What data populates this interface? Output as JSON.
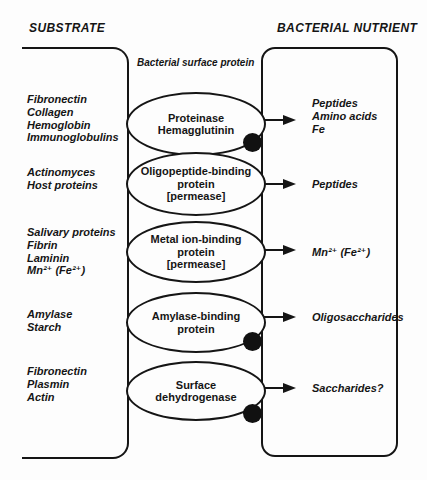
{
  "headers": {
    "substrate": "SUBSTRATE",
    "nutrient": "BACTERIAL NUTRIENT",
    "surface_protein": "Bacterial surface protein"
  },
  "colors": {
    "ink": "#151515",
    "background": "#fdfdfd"
  },
  "rows": [
    {
      "substrates": [
        "Fibronectin",
        "Collagen",
        "Hemoglobin",
        "Immunoglobulins"
      ],
      "protein_lines": [
        "Proteinase",
        "Hemagglutinin"
      ],
      "nutrients": [
        "Peptides",
        "Amino acids",
        "Fe"
      ],
      "membrane_dot": true
    },
    {
      "substrates": [
        "Actinomyces",
        "Host proteins"
      ],
      "protein_lines": [
        "Oligopeptide-binding",
        "protein",
        "[permease]"
      ],
      "nutrients": [
        "Peptides"
      ],
      "membrane_dot": false
    },
    {
      "substrates": [
        "Salivary proteins",
        "Fibrin",
        "Laminin",
        "Mn²⁺ (Fe²⁺)"
      ],
      "protein_lines": [
        "Metal ion-binding",
        "protein",
        "[permease]"
      ],
      "nutrients": [
        "Mn²⁺ (Fe²⁺)"
      ],
      "membrane_dot": false
    },
    {
      "substrates": [
        "Amylase",
        "Starch"
      ],
      "protein_lines": [
        "Amylase-binding",
        "protein"
      ],
      "nutrients": [
        "Oligosaccharides"
      ],
      "membrane_dot": true
    },
    {
      "substrates": [
        "Fibronectin",
        "Plasmin",
        "Actin"
      ],
      "protein_lines": [
        "Surface",
        "dehydrogenase"
      ],
      "nutrients": [
        "Saccharides?"
      ],
      "membrane_dot": true
    }
  ]
}
